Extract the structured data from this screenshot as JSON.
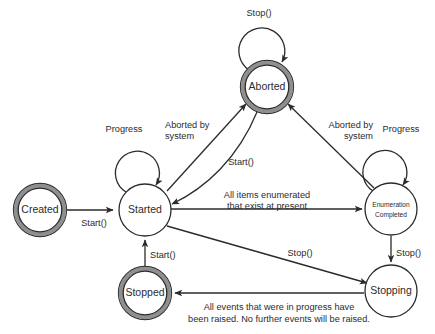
{
  "diagram": {
    "background_color": "#ffffff",
    "line_color": "#2b2b2b",
    "ring_color": "#8f8f8f",
    "states": [
      {
        "id": "created",
        "label": "Created",
        "type": "final-ring",
        "cx": 40,
        "cy": 210,
        "r": 25
      },
      {
        "id": "started",
        "label": "Started",
        "type": "simple",
        "cx": 145,
        "cy": 210,
        "r": 26
      },
      {
        "id": "aborted",
        "label": "Aborted",
        "type": "final-ring",
        "cx": 267,
        "cy": 87,
        "r": 25
      },
      {
        "id": "enumeration_completed",
        "label_line1": "Enumeration",
        "label_line2": "Completed",
        "type": "simple",
        "cx": 391,
        "cy": 209,
        "r": 26
      },
      {
        "id": "stopping",
        "label": "Stopping",
        "type": "simple",
        "cx": 391,
        "cy": 291,
        "r": 26
      },
      {
        "id": "stopped",
        "label": "Stopped",
        "type": "final-ring",
        "cx": 145,
        "cy": 293,
        "r": 25
      }
    ],
    "transitions": [
      {
        "id": "created-to-started",
        "from": "Created",
        "to": "Started",
        "label": "Start()"
      },
      {
        "id": "started-self-progress",
        "from": "Started",
        "to": "Started",
        "label": "Progress"
      },
      {
        "id": "started-to-aborted",
        "from": "Started",
        "to": "Aborted",
        "label_line1": "Aborted by",
        "label_line2": "system"
      },
      {
        "id": "aborted-to-started",
        "from": "Aborted",
        "to": "Started",
        "label": "Start()"
      },
      {
        "id": "aborted-self-stop",
        "from": "Aborted",
        "to": "Aborted",
        "label": "Stop()"
      },
      {
        "id": "enumeration-to-aborted",
        "from": "Enumeration Completed",
        "to": "Aborted",
        "label_line1": "Aborted by",
        "label_line2": "system"
      },
      {
        "id": "started-to-enumeration",
        "from": "Started",
        "to": "Enumeration Completed",
        "label_line1": "All items enumerated",
        "label_line2": "that exist at present"
      },
      {
        "id": "enumeration-self-progress",
        "from": "Enumeration Completed",
        "to": "Enumeration Completed",
        "label": "Progress"
      },
      {
        "id": "enumeration-to-stopping",
        "from": "Enumeration Completed",
        "to": "Stopping",
        "label": "Stop()"
      },
      {
        "id": "started-to-stopping",
        "from": "Started",
        "to": "Stopping",
        "label": "Stop()"
      },
      {
        "id": "stopping-to-stopped",
        "from": "Stopping",
        "to": "Stopped",
        "label_line1": "All events that were in progress have",
        "label_line2": "been raised. No further events will be raised."
      },
      {
        "id": "stopped-to-started",
        "from": "Stopped",
        "to": "Started",
        "label": "Start()"
      }
    ],
    "labels": {
      "created": "Created",
      "started": "Started",
      "aborted": "Aborted",
      "enumeration_line1": "Enumeration",
      "enumeration_line2": "Completed",
      "stopping": "Stopping",
      "stopped": "Stopped",
      "start_call": "Start()",
      "stop_call": "Stop()",
      "progress": "Progress",
      "aborted_by_1": "Aborted by",
      "aborted_by_2": "system",
      "all_items_1": "All items enumerated",
      "all_items_2": "that exist at present",
      "all_events_1": "All events that were in progress have",
      "all_events_2": "been raised. No further events will be raised.",
      "start_call_left": "Start()",
      "start_call_mid": "Start()",
      "start_call_bottom": "Start()",
      "stop_call_top": "Stop()",
      "stop_call_diag": "Stop()",
      "stop_call_right": "Stop()",
      "progress_left": "Progress",
      "progress_right": "Progress",
      "aborted_by_left_1": "Aborted by",
      "aborted_by_left_2": "system",
      "aborted_by_right_1": "Aborted by",
      "aborted_by_right_2": "system"
    }
  }
}
